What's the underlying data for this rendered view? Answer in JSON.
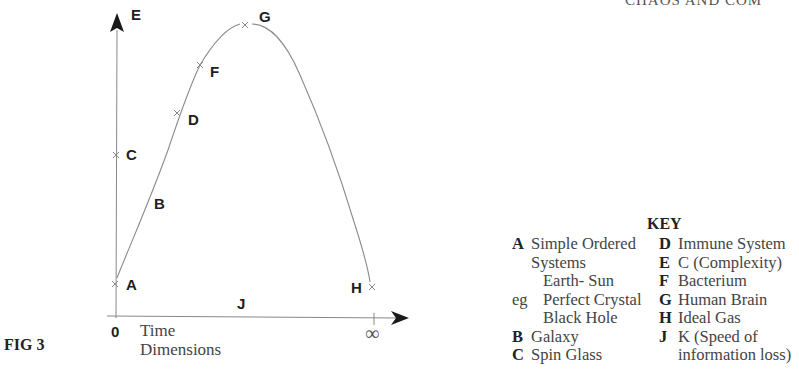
{
  "header": {
    "running_title": "CHAOS AND COM"
  },
  "figure": {
    "label": "FIG 3",
    "y_axis_label": "E",
    "x_axis_label": "J",
    "x_origin_label": "0",
    "x_end_label": "∞",
    "x_axis_caption_line1": "Time",
    "x_axis_caption_line2": "Dimensions"
  },
  "points": [
    {
      "id": "A",
      "label": "A",
      "x": 115,
      "y": 284
    },
    {
      "id": "B",
      "label": "B",
      "x": 160,
      "y": 203
    },
    {
      "id": "C",
      "label": "C",
      "x": 116,
      "y": 155
    },
    {
      "id": "D",
      "label": "D",
      "x": 177,
      "y": 113
    },
    {
      "id": "F",
      "label": "F",
      "x": 200,
      "y": 65
    },
    {
      "id": "G",
      "label": "G",
      "x": 245,
      "y": 25
    },
    {
      "id": "H",
      "label": "H",
      "x": 372,
      "y": 287
    }
  ],
  "key": {
    "title": "KEY",
    "left": [
      {
        "letter": "A",
        "text": "Simple Ordered",
        "indent": 0
      },
      {
        "letter": "",
        "text": "Systems",
        "indent": 0
      },
      {
        "letter": "",
        "text": "Earth- Sun",
        "indent": 1
      },
      {
        "letter": "eg",
        "text": "Perfect Crystal",
        "indent": 1
      },
      {
        "letter": "",
        "text": "Black Hole",
        "indent": 1
      },
      {
        "letter": "B",
        "text": "Galaxy",
        "indent": 0
      },
      {
        "letter": "C",
        "text": "Spin Glass",
        "indent": 0
      }
    ],
    "right": [
      {
        "letter": "D",
        "text": "Immune System"
      },
      {
        "letter": "E",
        "text": "C (Complexity)"
      },
      {
        "letter": "F",
        "text": "Bacterium"
      },
      {
        "letter": "G",
        "text": "Human Brain"
      },
      {
        "letter": "H",
        "text": "Ideal Gas"
      },
      {
        "letter": "J",
        "text": "K (Speed of"
      },
      {
        "letter": "",
        "text": "information loss)"
      }
    ]
  },
  "colors": {
    "curve": "#8a8a8a",
    "axis": "#777777",
    "arrow": "#1a1a1a",
    "text": "#222222"
  }
}
